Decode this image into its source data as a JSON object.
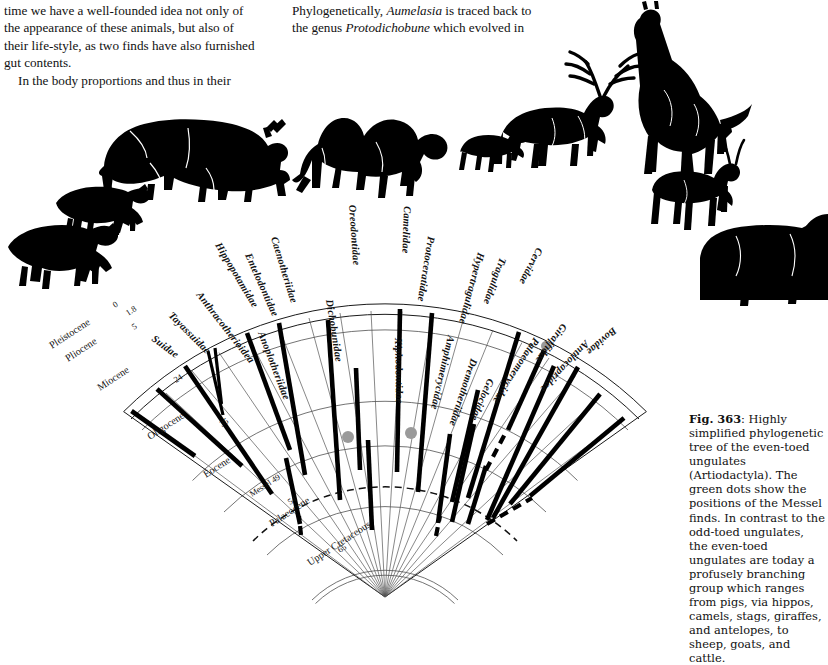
{
  "page": {
    "body_left": [
      "time we have a well-founded idea not only of",
      "the appearance of these animals, but also of",
      "their life-style, as two finds have also furnished",
      "gut contents.",
      "In the body proportions and thus in their"
    ],
    "body_mid_pre": "Phylogenetically, ",
    "body_mid_italic1": "Aumelasia",
    "body_mid_post1": " is traced back to",
    "body_mid_line2_pre": "the genus ",
    "body_mid_italic2": "Protodichobune",
    "body_mid_post2": " which evolved in"
  },
  "caption": {
    "figure_number": "Fig. 363",
    "text": ": Highly simplified phylogenetic tree of the even-toed ungulates (Artiodactyla). The green dots show the positions of the Messel finds. In contrast to the odd-toed ungulates, the even-toed ungulates are today a profusely branching group which ranges from pigs, via hippos, camels, stags, giraffes, and antelopes, to sheep, goats, and cattle."
  },
  "figure": {
    "messel_label": "Messel 49",
    "epochs": [
      {
        "name": "Pleistocene",
        "age_top": "0",
        "age_bottom": "1.8"
      },
      {
        "name": "Pliocene",
        "age_bottom": "5"
      },
      {
        "name": "Miocene",
        "age_bottom": "24"
      },
      {
        "name": "Oligocene",
        "age_bottom": "35"
      },
      {
        "name": "Eocene",
        "age_bottom": "54"
      },
      {
        "name": "Palaeocene",
        "age_bottom": "65"
      },
      {
        "name": "Upper Cretaceous",
        "age_bottom": ""
      }
    ],
    "families": [
      "Suidae",
      "Tayassuidae",
      "Anthracotherioidea",
      "Hippopotamidae",
      "Entelodontidae",
      "Caenotheriidae",
      "Anoplotheriidae",
      "Dichobunidae",
      "Oreodontidae",
      "Xiphodontidae",
      "Camelidae",
      "Protoceratidae",
      "Amphimerycidae",
      "Hypertragulidae",
      "Dremotheriidae",
      "Tragulidae",
      "Gelocidae",
      "Cervidae",
      "Palaeomerycidae",
      "Giraffidae",
      "Antilocapridae",
      "Bovidae"
    ],
    "dot_color": "#9a9a9a",
    "dot_count": 2,
    "animals": [
      "warthog-silhouette",
      "peccary-silhouette",
      "hippopotamus-silhouette",
      "camel-silhouette",
      "chevrotain-silhouette",
      "stag-silhouette",
      "giraffe-silhouette",
      "gazelle-silhouette",
      "cattle-silhouette"
    ]
  }
}
